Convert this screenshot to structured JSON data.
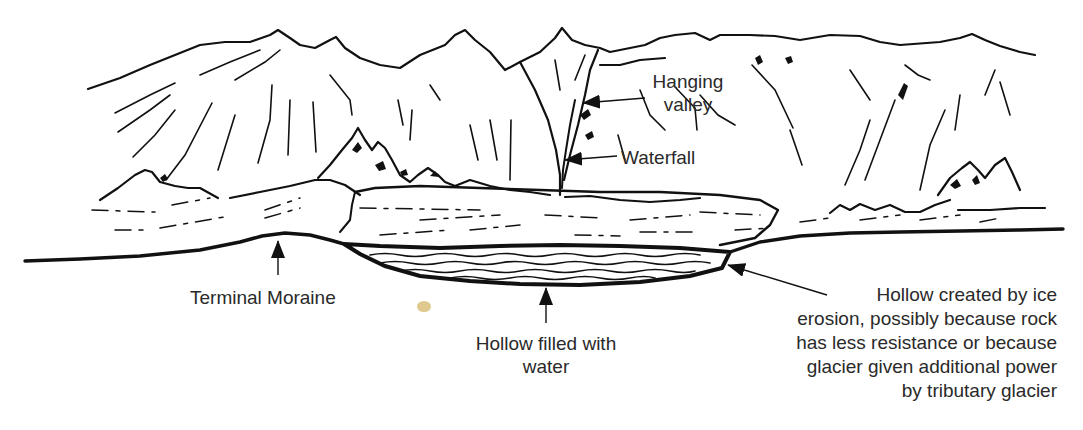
{
  "diagram": {
    "colors": {
      "ink": "#111111",
      "label_text": "#2a2a2a",
      "background": "#ffffff",
      "stain": "#d9c07a"
    },
    "labels": {
      "hanging_valley": {
        "lines": [
          "Hanging",
          "valley"
        ]
      },
      "waterfall": {
        "text": "Waterfall"
      },
      "terminal_moraine": {
        "text": "Terminal Moraine"
      },
      "hollow_water": {
        "lines": [
          "Hollow filled with",
          "water"
        ]
      },
      "hollow_erosion": {
        "lines": [
          "Hollow created by ice",
          "erosion, possibly because rock",
          "has less resistance or because",
          "glacier given additional power",
          "by tributary glacier"
        ]
      }
    },
    "arrows": [
      {
        "name": "hanging-valley-arrow",
        "from": [
          645,
          98
        ],
        "to": [
          583,
          103
        ]
      },
      {
        "name": "waterfall-arrow",
        "from": [
          617,
          156
        ],
        "to": [
          565,
          160
        ]
      },
      {
        "name": "terminal-moraine-arrow",
        "from": [
          278,
          275
        ],
        "to": [
          278,
          240
        ]
      },
      {
        "name": "hollow-water-arrow",
        "from": [
          546,
          323
        ],
        "to": [
          546,
          287
        ]
      },
      {
        "name": "hollow-erosion-arrow",
        "from": [
          827,
          295
        ],
        "to": [
          727,
          265
        ]
      }
    ]
  }
}
